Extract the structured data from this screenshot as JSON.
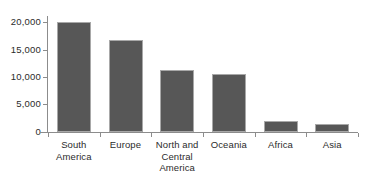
{
  "chart_data": {
    "type": "bar",
    "title": "",
    "xlabel": "",
    "ylabel": "",
    "categories": [
      "South America",
      "Europe",
      "North and Central America",
      "Oceania",
      "Africa",
      "Asia"
    ],
    "category_lines": [
      [
        "South",
        "America"
      ],
      [
        "Europe"
      ],
      [
        "North and",
        "Central",
        "America"
      ],
      [
        "Oceania"
      ],
      [
        "Africa"
      ],
      [
        "Asia"
      ]
    ],
    "values": [
      20200,
      16800,
      11400,
      10700,
      2000,
      1400
    ],
    "ylim": [
      0,
      22000
    ],
    "yticks": [
      0,
      5000,
      10000,
      15000,
      20000
    ],
    "ytick_labels": [
      "0",
      "5,000",
      "10,000",
      "15,000",
      "20,000"
    ],
    "grid": false,
    "legend": null,
    "bar_color": "#575757",
    "bar_edge_color": "#a8a8a8",
    "axis_color": "#8c8c8c",
    "text_color": "#2b2b2b",
    "background": "#ffffff"
  }
}
